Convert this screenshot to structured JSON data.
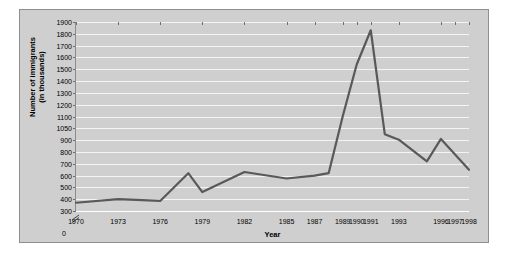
{
  "chart_data": {
    "type": "line",
    "title": "",
    "xlabel": "Year",
    "ylabel": "Number of immigrants\n(in thousands)",
    "ylabel_line1": "Number of immigrants",
    "ylabel_line2": "(in thousands)",
    "grid": true,
    "legend": null,
    "axis_break": "y-axis broken between 0 and 300",
    "ytick_labels": [
      "1900",
      "1800",
      "1700",
      "1600",
      "1500",
      "1400",
      "1300",
      "1200",
      "1100",
      "1050",
      "900",
      "800",
      "700",
      "600",
      "500",
      "400",
      "300",
      "0"
    ],
    "ytick_values": [
      1900,
      1800,
      1700,
      1600,
      1500,
      1400,
      1300,
      1200,
      1100,
      1050,
      900,
      800,
      700,
      600,
      500,
      400,
      300,
      0
    ],
    "ylim": [
      300,
      1900
    ],
    "xtick_labels": [
      "1970",
      "1973",
      "1976",
      "1979",
      "1982",
      "1985",
      "1987",
      "1989",
      "1990",
      "1991",
      "1993",
      "1996",
      "1997",
      "1998"
    ],
    "categories": [
      1970,
      1971,
      1972,
      1973,
      1974,
      1975,
      1976,
      1977,
      1978,
      1979,
      1980,
      1981,
      1982,
      1983,
      1984,
      1985,
      1986,
      1987,
      1988,
      1989,
      1990,
      1991,
      1992,
      1993,
      1994,
      1995,
      1996,
      1997,
      1998
    ],
    "series": [
      {
        "name": "Number of immigrants",
        "color": "#595959",
        "points": [
          {
            "year": 1970,
            "value": 370
          },
          {
            "year": 1973,
            "value": 400
          },
          {
            "year": 1976,
            "value": 385
          },
          {
            "year": 1978,
            "value": 620
          },
          {
            "year": 1979,
            "value": 460
          },
          {
            "year": 1982,
            "value": 630
          },
          {
            "year": 1985,
            "value": 575
          },
          {
            "year": 1987,
            "value": 600
          },
          {
            "year": 1988,
            "value": 620
          },
          {
            "year": 1989,
            "value": 1100
          },
          {
            "year": 1990,
            "value": 1540
          },
          {
            "year": 1991,
            "value": 1830
          },
          {
            "year": 1992,
            "value": 975
          },
          {
            "year": 1993,
            "value": 905
          },
          {
            "year": 1995,
            "value": 720
          },
          {
            "year": 1996,
            "value": 915
          },
          {
            "year": 1998,
            "value": 650
          }
        ]
      }
    ],
    "colors": {
      "panel": "#c9c9c9",
      "figure": "#cfcfcf",
      "gridline": "#f4f4f4",
      "line": "#595959",
      "border": "#8e8e8e",
      "text": "#000000"
    }
  }
}
